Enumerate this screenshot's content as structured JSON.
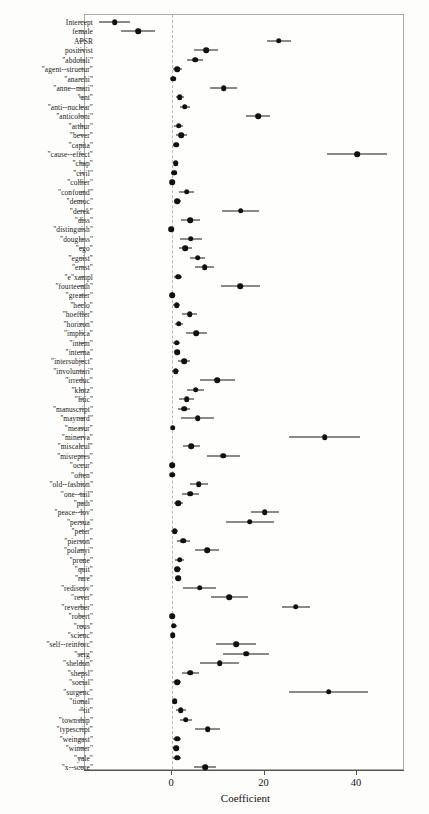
{
  "chart_data": {
    "type": "scatter",
    "title": "",
    "subtitle": "",
    "xlabel": "Coefficient",
    "ylabel": "",
    "xlim": [
      -15,
      52
    ],
    "xticks": [
      0,
      20,
      40
    ],
    "xticklabels": [
      "0",
      "20",
      "40"
    ],
    "grid": false,
    "legend": null,
    "annotations": [
      "dashed vertical reference line at x = 0"
    ],
    "orientation": "horizontal",
    "error_bars": "95% confidence intervals",
    "categories": [
      "Intercept",
      "female",
      "APSR",
      "positivist",
      "\"abdolali\"",
      "\"agent--structur\"",
      "\"anarchi\"",
      "\"anne--mari\"",
      "\"ant\"",
      "\"anti--nuclear\"",
      "\"anticoloni\"",
      "\"arthur\"",
      "\"bever\"",
      "\"capita\"",
      "\"cause--effect\"",
      "\"chap\"",
      "\"civil\"",
      "\"collier\"",
      "\"confound\"",
      "\"democ\"",
      "\"derek\"",
      "\"diss\"",
      "\"distinguish\"",
      "\"douglass\"",
      "\"ego\"",
      "\"egoist\"",
      "\"ernst\"",
      "\"e\"xampl",
      "\"fourteenth\"",
      "\"greater\"",
      "\"heclo\"",
      "\"hoeffler\"",
      "\"horizon\"",
      "\"implica\"",
      "\"intem\"",
      "\"interna\"",
      "\"intersubject\"",
      "\"involuntari\"",
      "\"irreduc\"",
      "\"klotz\"",
      "\"litic\"",
      "\"manuscript\"",
      "\"maynard\"",
      "\"measur\"",
      "\"minerva\"",
      "\"miscalcul\"",
      "\"misrepres\"",
      "\"occur\"",
      "\"often\"",
      "\"old--fashion\"",
      "\"one--tail\"",
      "\"path\"",
      "\"peace--lov\"",
      "\"persua\"",
      "\"peter\"",
      "\"pierson\"",
      "\"polanyi\"",
      "\"prone\"",
      "\"quit\"",
      "\"rare\"",
      "\"rediscov\"",
      "\"rever\"",
      "\"reverber\"",
      "\"robert\"",
      "\"rous\"",
      "\"scienc\"",
      "\"self--reinforc\"",
      "\"serg\"",
      "\"sheldon\"",
      "\"shepsl\"",
      "\"social\"",
      "\"surgenc\"",
      "\"tional\"",
      "\"tit\"",
      "\"township\"",
      "\"typescript\"",
      "\"weingast\"",
      "\"winner\"",
      "\"yale\"",
      "\"x--score\""
    ],
    "values": [
      -12.2,
      -7.1,
      23.3,
      7.6,
      5.2,
      1.4,
      0.5,
      11.4,
      1.9,
      3.0,
      18.8,
      1.7,
      2.2,
      1.1,
      40.3,
      1.0,
      0.7,
      0.3,
      3.4,
      1.4,
      15.1,
      4.2,
      0.1,
      4.3,
      3.1,
      5.8,
      7.3,
      1.5,
      15.0,
      0.2,
      1.2,
      4.0,
      1.7,
      5.5,
      1.2,
      1.3,
      2.9,
      1.0,
      10.0,
      5.3,
      3.4,
      2.8,
      5.8,
      0.4,
      33.2,
      4.4,
      11.3,
      0.3,
      0.3,
      6.0,
      4.2,
      1.6,
      20.3,
      17.0,
      0.8,
      2.7,
      7.8,
      1.9,
      1.4,
      1.5,
      6.2,
      12.6,
      27.0,
      0.2,
      0.6,
      0.4,
      14.1,
      16.2,
      10.5,
      4.2,
      1.3,
      34.1,
      0.8,
      2.1,
      3.2,
      7.9,
      1.3,
      1.1,
      1.3,
      7.4
    ],
    "ci_low": [
      -15.6,
      -10.8,
      20.7,
      5.0,
      3.4,
      0.5,
      0.0,
      8.5,
      1.0,
      2.0,
      16.2,
      0.7,
      1.0,
      0.4,
      33.8,
      0.4,
      0.1,
      -0.2,
      1.8,
      0.6,
      11.1,
      2.2,
      -0.4,
      2.0,
      1.7,
      4.2,
      5.2,
      0.7,
      10.8,
      -0.3,
      0.4,
      2.4,
      0.8,
      3.2,
      0.5,
      0.6,
      1.6,
      0.3,
      6.2,
      3.4,
      1.8,
      1.5,
      2.2,
      -0.1,
      25.5,
      2.6,
      7.7,
      -0.2,
      -0.1,
      4.0,
      2.4,
      0.7,
      17.2,
      11.8,
      0.1,
      1.3,
      5.2,
      0.9,
      0.7,
      0.8,
      2.6,
      8.6,
      24.0,
      -0.3,
      0.0,
      -0.1,
      9.8,
      11.2,
      6.2,
      2.4,
      0.5,
      25.6,
      0.2,
      1.0,
      1.9,
      5.2,
      0.5,
      0.4,
      0.5,
      5.0
    ],
    "ci_high": [
      -8.8,
      -3.4,
      25.9,
      10.2,
      7.0,
      2.3,
      1.0,
      14.3,
      2.8,
      4.0,
      21.4,
      2.7,
      3.4,
      1.8,
      46.8,
      1.6,
      1.3,
      0.8,
      5.0,
      2.2,
      19.1,
      6.2,
      0.6,
      6.6,
      4.5,
      7.4,
      9.4,
      2.3,
      19.2,
      0.7,
      2.0,
      5.6,
      2.6,
      7.8,
      1.9,
      2.0,
      4.2,
      1.7,
      13.8,
      7.2,
      5.0,
      4.1,
      9.4,
      0.9,
      40.9,
      6.2,
      14.9,
      0.8,
      0.7,
      8.0,
      6.0,
      2.5,
      23.4,
      22.2,
      1.5,
      4.1,
      10.4,
      2.9,
      2.1,
      2.2,
      9.8,
      16.6,
      30.0,
      0.7,
      1.2,
      0.9,
      18.4,
      21.2,
      14.8,
      6.0,
      2.1,
      42.6,
      1.4,
      3.2,
      4.5,
      10.6,
      2.1,
      1.8,
      2.1,
      9.8
    ]
  }
}
